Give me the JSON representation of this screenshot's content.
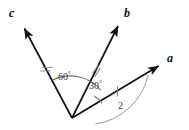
{
  "figure": {
    "background_color": "#ffffff",
    "stroke_color": "#111111",
    "arc_color": "#777777",
    "tick_color": "#888888",
    "origin": {
      "x": 72,
      "y": 118
    }
  },
  "vectors": [
    {
      "name": "c",
      "label": "c",
      "label_x": 9,
      "label_y": 7,
      "tip_x": 22,
      "tip_y": 25,
      "tick_x": 46,
      "tick_y": 70,
      "tick_marks": 2,
      "angle_deg": 104
    },
    {
      "name": "b",
      "label": "b",
      "label_x": 124,
      "label_y": 7,
      "tip_x": 120,
      "tip_y": 22,
      "tick_x": 96,
      "tick_y": 69,
      "tick_marks": 2,
      "angle_deg": 44
    },
    {
      "name": "a",
      "label": "a",
      "label_x": 167,
      "label_y": 52,
      "tip_x": 161,
      "tip_y": 63,
      "tick_x": 117,
      "tick_y": 90,
      "tick_marks": 1,
      "angle_deg": 14
    }
  ],
  "angles": [
    {
      "name": "angle-c-b",
      "value": "60",
      "unit": "°",
      "label_x": 58,
      "label_y": 71,
      "arc_radius": 40,
      "from": "b",
      "to": "c"
    },
    {
      "name": "angle-b-a",
      "value": "30",
      "unit": "°",
      "label_x": 89,
      "label_y": 80,
      "arc_radius": 31,
      "from": "a",
      "to": "b"
    }
  ],
  "magnitude": {
    "name": "magnitude-a",
    "label": "2",
    "label_x": 118,
    "label_y": 101,
    "arc_radius": 63
  }
}
